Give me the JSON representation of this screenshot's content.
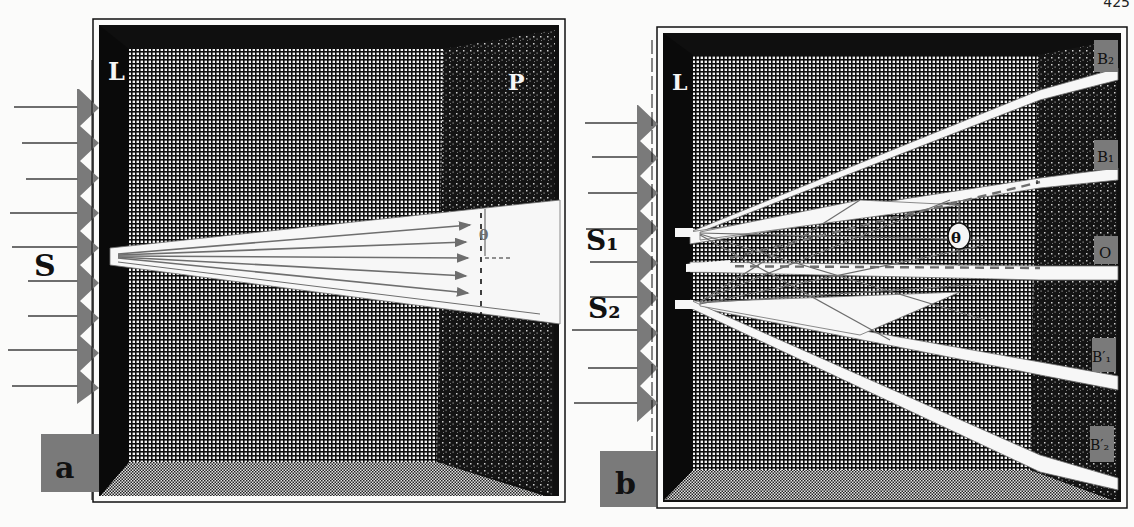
{
  "page": {
    "number": "425"
  },
  "figure_a": {
    "panel_label": "a",
    "lens_label": "L",
    "plate_label": "P",
    "source_label": "S",
    "angle_label": "θ"
  },
  "figure_b": {
    "panel_label": "b",
    "lens_label": "L",
    "source1_label": "S₁",
    "source2_label": "S₂",
    "angle_label": "θ",
    "beam_labels": [
      "B₂",
      "B₁",
      "O",
      "B′₁",
      "B′₂"
    ]
  },
  "colors": {
    "ink": "#111111",
    "gray_fill": "#7a7a7a",
    "beam_line": "#6e6e6e",
    "paper": "#fbfbfa",
    "white_beam": "#f7f7f7"
  }
}
